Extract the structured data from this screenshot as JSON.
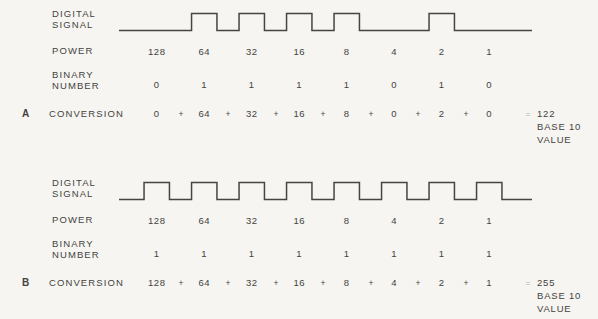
{
  "colors": {
    "background": "#f6f5f1",
    "ink": "#434341",
    "line": "#454543",
    "faint_equals": "#b5b1a9"
  },
  "sections": [
    {
      "section_letter": "A",
      "digital_signal_label": [
        "DIGITAL",
        "SIGNAL"
      ],
      "power_label": "POWER",
      "binary_number_label": [
        "BINARY",
        "NUMBER"
      ],
      "conversion_label": "CONVERSION",
      "power_values": [
        "128",
        "64",
        "32",
        "16",
        "8",
        "4",
        "2",
        "1"
      ],
      "binary_digits": [
        "0",
        "1",
        "1",
        "1",
        "1",
        "0",
        "1",
        "0"
      ],
      "conversion_terms": [
        "0",
        "64",
        "32",
        "16",
        "8",
        "0",
        "2",
        "0"
      ],
      "operator_plus": "+",
      "operator_equals": "=",
      "result": {
        "value": "122",
        "line2": "BASE 10",
        "line3": "VALUE"
      }
    },
    {
      "section_letter": "B",
      "digital_signal_label": [
        "DIGITAL",
        "SIGNAL"
      ],
      "power_label": "POWER",
      "binary_number_label": [
        "BINARY",
        "NUMBER"
      ],
      "conversion_label": "CONVERSION",
      "power_values": [
        "128",
        "64",
        "32",
        "16",
        "8",
        "4",
        "2",
        "1"
      ],
      "binary_digits": [
        "1",
        "1",
        "1",
        "1",
        "1",
        "1",
        "1",
        "1"
      ],
      "conversion_terms": [
        "128",
        "64",
        "32",
        "16",
        "8",
        "4",
        "2",
        "1"
      ],
      "operator_plus": "+",
      "operator_equals": "=",
      "result": {
        "value": "255",
        "line2": "BASE 10",
        "line3": "VALUE"
      }
    }
  ]
}
